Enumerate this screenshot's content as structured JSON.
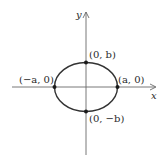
{
  "diagram": {
    "type": "ellipse-on-axes",
    "axes": {
      "x_label": "x",
      "y_label": "y"
    },
    "points": [
      {
        "id": "top",
        "label": "(0, b)"
      },
      {
        "id": "bottom",
        "label": "(0, −b)"
      },
      {
        "id": "left",
        "label": "(−a, 0)"
      },
      {
        "id": "right",
        "label": "(a, 0)"
      }
    ],
    "colors": {
      "axis": "#6a6a6a",
      "curve": "#333333",
      "point": "#1a1a1a",
      "text": "#2a2a2a"
    }
  }
}
